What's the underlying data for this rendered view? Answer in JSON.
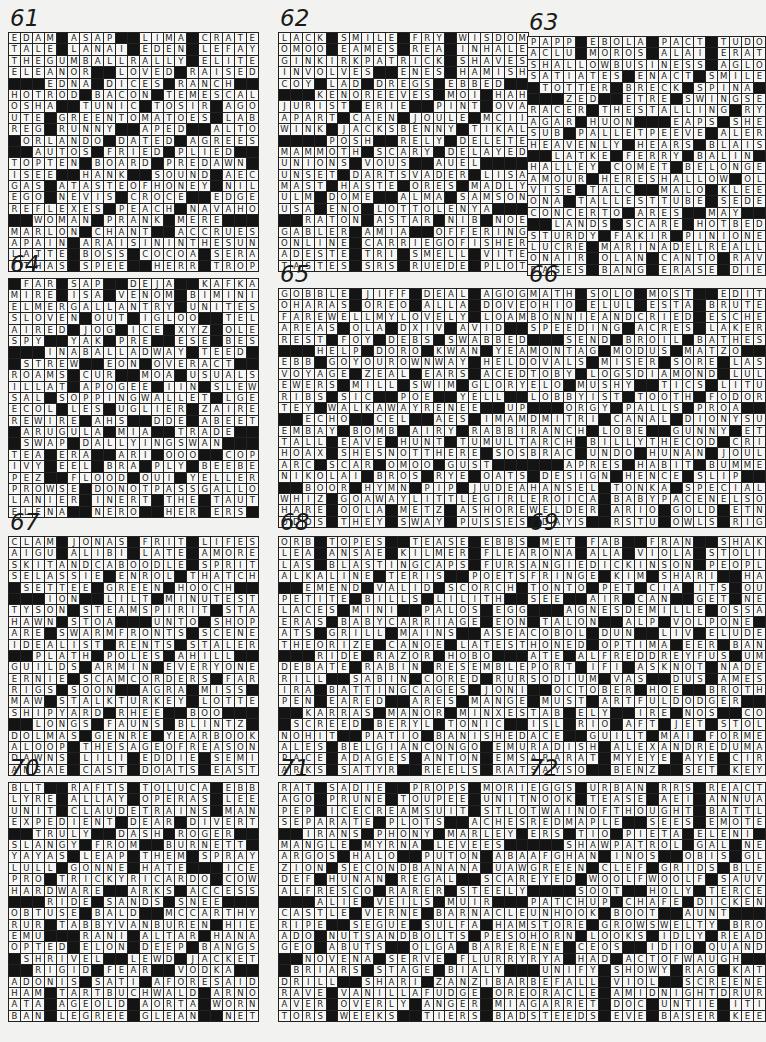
{
  "page": {
    "puzzles": [
      {
        "number": "61",
        "rows": [
          "EDAM#ASAP##LIMA#CRATE",
          "TALE#LANAI#EDEN#LEFAY",
          "THEGUMBALLRALLY#ELITE",
          "ELEANOR##LOVED#RAISED",
          "###EDNA#DICES#RANCH##",
          "HOTROD#BACON#TEMESCAL",
          "OSHA##TUNIC#TOSIR#AGO",
          "UTE#GREENTOMATOES#LAB",
          "REG#RUNNY##APED##ALTO",
          "#ORLANDO#DATED#AGREES",
          "##AUTOS#FRIED#PLIED##",
          "TOPTEN#BOARD#PREDAWN#",
          "ISEE##HANK##SOUND#AEC",
          "GAS#ATASTEOFHONEY#NIL",
          "EGO#NEVIS#CROCE##EDGE",
          "REFLEXES#PEACH#NAVAHO",
          "##WOMAN#PRANK#MERE###",
          "MARLON#CHANT##ACCRUES",
          "APAIN#ARAISININTHESUN",
          "LATTE#BOSS#COCOA#SERA",
          "ITHAS#SPEE##HERR#TROP"
        ]
      },
      {
        "number": "62",
        "rows": [
          "LACK#SMILE#FRY#WISDOM",
          "OMOO#EAMES#REA#INHALE",
          "GINKIRKPATRICK#SHAVES",
          "INVOLVES##ENES#HAMISH",
          "COY#LAD#DREGS#EBBED##",
          "###KENOREEVES#MOI#HAH",
          "JURIST#ERIE##PINT#OVA",
          "APART#CAEN#JOULE#MCII",
          "WINK#JACKSBENNY#TIKAL",
          "####POSH##RELY#DELETE",
          "MAMMOTH#SCARY#DELAYED",
          "UNIONS#VOUS##AUEL####",
          "UNSET#DARTSVADER#LISA",
          "MAST#HASTE#ORES#MADLY",
          "ULM#DOME##ALMA#SAMSON",
          "USA#ENO#LOTTOLENYA###",
          "##RATON#ASTAR#NIB#NOE",
          "GABLER#AMIA##OFFERING",
          "ONLINE#CARRIEGOFISHER",
          "ADESTE#TRI#SMELL#VITE",
          "TASTES#SRS#RUEDE#PLOT"
        ]
      },
      {
        "number": "63",
        "rows": [
          "PAPP#EBOLA#PACT#TUDOR",
          "ACLU#MOROS#ALAI#ERATO",
          "SHALLOWBUSINESS#AGLOW",
          "SATIATES#ENACT#SMILES",
          "#TOTTER#BRECK#SPINA##",
          "###ZED##ETRE#SWINGSET",
          "RACER#THESTALLING#RYA",
          "AGAR#HUON###EAPS#SHES",
          "SUB#PALLETPEEVE#ALERT",
          "HEAVENLY#HEARS#BLAISE",
          "##LATKE#FERRY#BALIN##",
          "HALLEY#COMET#BELONGED",
          "AMOUR#HERESHALLOW#OLE",
          "VISE#TALC##MALO#KLEE",
          "ONA#TALLESTTUBE#SEDER",
          "CONCERTO#ARES##MAY###",
          "##LANDS#SCARE#HOTBED#",
          "STURDY#FAKIR#PINIONED",
          "LUCRE#MARINADELREALLY",
          "ONAIR#OLAN#CANTO#RAVE",
          "BASES#BANG#ERASE#DIED"
        ]
      },
      {
        "number": "64",
        "rows": [
          "#FAR#SAP##DEJA##KAFKA",
          "MIRE#ISA#VENOM#BIMINI",
          "ELMERGALLANTRY#UNITES",
          "SLOVEN#OUT#IGLOO##TEL",
          "AIRED#JOG#ICE#XYZ#OLE",
          "SPY##YAK#PRE##ESE#BES",
          "###INABALLADWAY#TEED#",
          "#STREW##EON#OVERACT##",
          "ROAMS#CUR##MOA#USUALS",
          "ILLAT#APOGEE#IIN#SLEW",
          "SAL#SOPPINGWALLET#LGE",
          "ECOL#LES#UGLIER#ZAIRE",
          "REWIRE#AHS##DDE#ABEET",
          "#ARUGULA#MIA##TRADE#",
          "#SWAP#DALLYINGSWAN###",
          "TEA#ERA##ARI#OOO##COP",
          "IVY#EEL#BRA#PLY#BEEBE",
          "PEZ##FLOOD#OUI#YELLER",
          "PROWSE#DONOTPASSGALLO",
          "LANIER#INERT#THE#TAUT",
          "ELENA##NERO##HER#ERS#"
        ]
      },
      {
        "number": "65",
        "rows": [
          "GOBBLE#JIFF#DEAL#AGOG",
          "OHARAS#OREO#ALLA#DOVE",
          "FAREWELLMYLOVELY#LOAM",
          "AREAS#OLA#DXIV#AVID##",
          "REST#FOY#DEBS#SWABBED",
          "###HELP#DORO#KWAN#YEA",
          "EBB#GOYOUROWNWAY#HELD",
          "VOYAGE#ZEAL#EARS#ACED",
          "EWERS#MILL#SWIM#GLORY",
          "RIBS#SIC##POE##YELL##",
          "TEY#WALKAWAYRENEE##UPS",
          "##ECHO##CEL##AES#IMAM",
          "EMBAY#BOMB#AIRY#RABBI",
          "TALL#EAVE#HUNT#TUMULT",
          "HOAX#SHESNOTTHERE#SOS",
          "ARC#SCAR#OMOO#GUST###",
          "NIKOLAI#BROS#RYE#OATS",
          "##BOOR#HYMN#PIP#JUDEA",
          "WHIZ#GOAWAYLITTLEGIRL",
          "HARE#OOLA#METZ#ASHORE",
          "ODDS#THEY#SWAY#PUSSES"
        ]
      },
      {
        "number": "66",
        "rows": [
          "MATH#SOLO#MOST##EDIT#",
          "OHIO#ELUL#ESTA#BRUTES",
          "BONNIEANDCRIED#ESCHER",
          "SPEEDING#ACRES#LAKERS",
          "###SEND#BROIL#BATHES#",
          "MONTAG#MODUS#MATZO###",
          "OVALS#MISER#SORE#LASS",
          "TOBY#LOGSDIAMOND#LULU",
          "ELO#MUSHY##TICS#LITUP",
          "LOBBYIST#TOOTH#FODORS",
          "###ORGY#PALLS#PROA###",
          "DMITRI#CANAL#DIONYSUS",
          "RANCH#LOBE##GUNNY#ETO",
          "ARCH#BILLYTHECOD#CRIB",
          "BRAC#UNDO#HUNAN#JOULE",
          "###APRES#HABIT#BUMMER",
          "#DESIGN#HENCE#SLIP###",
          "HANSEL#TONKA#SPECIALS",
          "EROICA#BABYPACENELSON",
          "WELDER#ARIO#GOLD#ETNA",
          "#DAYS##RSTU#OWLS#RIGG"
        ]
      },
      {
        "number": "67",
        "rows": [
          "CLAM#JONAS#FRIT#LIFES",
          "AIGU#ALIBI#LATE#AMORE",
          "SKITANDCABOODLE#SPRIT",
          "SELASSIE#ENROL#THATCH",
          "#SETTEE#GREEN#HOOCH##",
          "###ION##LILT#MINUTEST",
          "TYSON#STEAMSPIRIT#STA",
          "HAWN#STOA###UNTO#SHOP",
          "ARE#SWARMFRONTS#SCENE",
          "IDEALIST#RENTS#STALER",
          "##PLATH#POLES#AHILL##",
          "GUILDS#ARMIN#EVERYONE",
          "ERNIE#SCAMCORDERS#FAR",
          "RIGS#SOON##AGRA#MISS",
          "MAW#STALKTURKEY#LOTTE",
          "SHIPYARD#RHEE##BOO###",
          "##LONGS#FAUNS#BLINTZ#",
          "DOLMAS#GENRE#YEARBOOK",
          "ALOOP#THESAGEOFREASON",
          "DAWNS#LILI#EDDIE#SEMI",
          "ANSAE#CAST#DOATS#EAST"
        ]
      },
      {
        "number": "68",
        "rows": [
          "ORB#TOPES##TEASE#EBBS",
          "LEA#ANSAE#KILMER#FLEA",
          "LAS#BLASTINGCAPS#FURS",
          "ALKALINE#TERIS##POETS",
          "##EMEND#VALID#SCORCH#",
          "PETITE#BILLS#LILITH##",
          "LACES#MINI##PALOS#EGG",
          "ERAS#BABYCARRIAGE#EON",
          "ATS#GRILL#MAINS##ASEA",
          "THEORIZE#CANOE#LATEST",
          "###RIDE#RAZOR#HOBO###",
          "DEBATE#RABIN#RESEMBLE",
          "RILL##SABIN#CORED#RUR",
          "IRA#BATTINGCAGES#JONI",
          "PEN#EARED##ARES#MANGE",
          "##KARRAS#MANOR#MINXES",
          "#SCREED#BERYL#TONIC##",
          "NOHIT##PATIO#BANISHED",
          "ALES#BELGIANCONGO#EMU",
          "PACE#ADAGES#ANTON#EMS",
          "ARKS#SATYR##REELS#RAT"
        ]
      },
      {
        "number": "69",
        "rows": [
          "#MET#FAB##FRAN##SHAKO",
          "RONA#ALA#VIOLA#STOLID",
          "ANGIEDICKINSON#PEOPLE",
          "FRINGE#KIM#SHARI##HAT",
          "TONTO#PET#CIA#ITS#OUT",
          "SEE##AIR#CAN##GET#NEE",
          "###AGNESDEMILLE#OSSA#",
          "#TALON##ALP#VOLPONE##",
          "COBOL#DUN##LIV#ELUDED",
          "HONED#OPTIMA#EER#BANE",
          "ATE#ALFREDDREYFUS#UMA",
          "PORT#IFI#ASKNOT#NADER",
          "SODIUM#VAS##DUS#AMESS",
          "##OCTOBER#HOE##BROTH#",
          "#MUST#ARTFULDODGER###",
          "TAB#ELY##IRE#NOS##COT",
          "ISL#RIO#AFT#JET#STOLE",
          "ACE##GUILT#MAI#FORMER",
          "RADISH#ALEXANDREDUMAS",
          "ARARAT#MYEYE#AYE#CIRE",
          "SAYSO##BENZ##SET#KEY#"
        ]
      },
      {
        "number": "70",
        "rows": [
          "BLT##RAFTS#TOLUCA#EBB",
          "LYRE#ALLAY#OPERAS#LEE",
          "UNIT#CLAUDETRAINS#MAN",
          "EXPEDIENT#DEAR#DIVERT",
          "##TRULY##DASH#ROGER##",
          "SLANGY#FROM##BURNETT#",
          "YAYAS#LEAP#THEM#SPRAY",
          "LULL#GONNE#HATE###ICE",
          "PRO#TRICKYRICARDO#COW",
          "HARDWARE##ARKS#ACCESS",
          "###RIDE#SANDS#SNEE###",
          "OBTUSE#BALD##MCCARTHY",
          "RUR#TABBYVANBUREN#HIE",
          "EMU###RANI#ALTAR#HANA",
          "OPTED#ELON#DEEP#BANGS",
          "#SHRIVEL##LEWD#JACKET",
          "##RIGID#FEAR##VODKA##",
          "ADONIS#SATI#AFORESAID",
          "HAM#TARTBUCHWALD#ARNO",
          "ATA#AGEOLD#AORTA#WORN",
          "BAN#LEGREE#GLEAN##NET"
        ]
      },
      {
        "number": "71",
        "rows": [
          "RAT#SADIE##PROPS#MORI",
          "AGO#PRUNE#TOUPEE#UNIT",
          "PEP#ICECREAMSUIT#STLO",
          "SEPARATE#PLOTS##ACHES",
          "##IRANS#PHONY#MARLEY#",
          "MANGLE#MYRNA#LEVEES##",
          "ARGOS#HALO##PUTON#ABA",
          "ZION#SECONDBANANA#UAW",
          "DEF#HUNAN#REGAL##SCAR",
          "ALFRESCO#RARER#STEELY",
          "###ALIE#VEILS#MUIR###",
          "CASTLE#VERNE#BARNACLE",
          "RIPE##SEGUE#SULFA#HAM",
          "ADO#NUTSANDBOLTS#PESO",
          "GEO#ABUTS##OLGA#BARER",
          "##NOVENA#SERVE#FLURRY",
          "#BRIARS#STAGE#BIALY##",
          "DRILL##SHARI#ZANZIBAR",
          "RAVE#VANILLAFUDGE#ORE",
          "AVER#OVERLY#ANGER#MIA",
          "TORS#WEEKS##TIERS#BAD"
        ]
      },
      {
        "number": "72",
        "rows": [
          "EGGS#URBAN#RRS#REACTS",
          "NOOK#TEASE#AEI#ANNUAL",
          "TWAINOFTHOUGHT#BATTLE",
          "REDMAPLE##SEES#EMOTED",
          "ERS#TIO#PIETA#ELENI##",
          "###SHAWPATROL#GAL#NET",
          "AFGHAN#INOS##OBIS#GLO",
          "GREEN#CLEF#GRIDS#BLEW",
          "EYED#WOOLFWOOLF#SAUVE",
          "####SOOT##HOLY#TERCEL",
          "PATCHUP#CHAFE#DICKENS",
          "UNHOOK#BOOT##AUNT####",
          "STORE#GROWSWELTY#BROW",
          "HORN#LOOKS#IDLY#READY",
          "ENE#CEOS##IDIO#QUANDO",
          "RYA#HAD#ACTOFWAUGH###",
          "#UNIFY#SHOWY#RAG#KAT",
          "BEFALL#VIOL##SCREENER",
          "ORACLE#AMIDNIGHTDRURY",
          "GARRET#DOC#UNTIE#ITIS",
          "STEEDS#EVE#BASER#KEET"
        ]
      }
    ]
  }
}
